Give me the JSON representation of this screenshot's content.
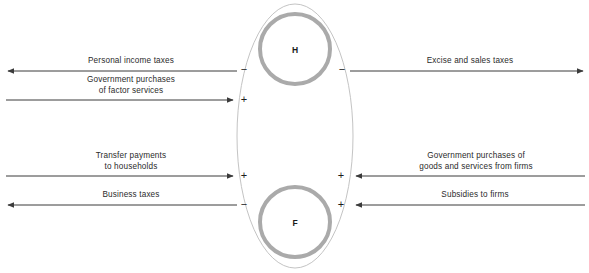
{
  "diagram": {
    "type": "circular-flow-government-sector",
    "nodes": [
      {
        "id": "households",
        "label": "H",
        "cx": 295,
        "cy": 49,
        "r": 35
      },
      {
        "id": "firms",
        "label": "F",
        "cx": 295,
        "cy": 222,
        "r": 35
      }
    ],
    "ellipse": {
      "cx": 295,
      "cy": 136,
      "rx": 58,
      "ry": 132
    },
    "colors": {
      "ring": "#a8a8a8",
      "ellipse_outline": "#bdbdbd",
      "arrow": "#3b3b3b",
      "text": "#2b2b2b"
    },
    "flows": [
      {
        "id": "personal-income-taxes",
        "label": "Personal income taxes",
        "side": "left",
        "direction": "left",
        "y": 71,
        "x_start": 237,
        "x_end": 6,
        "sign": "−",
        "sign_x": 240,
        "sign_y": 66
      },
      {
        "id": "government-purchases-factor-services",
        "label": "Government purchases\nof factor services",
        "side": "left",
        "direction": "right",
        "y": 100,
        "x_start": 6,
        "x_end": 235,
        "sign": "+",
        "sign_x": 240,
        "sign_y": 95
      },
      {
        "id": "transfer-payments-households",
        "label": "Transfer payments\nto households",
        "side": "left",
        "direction": "right",
        "y": 176,
        "x_start": 6,
        "x_end": 235,
        "sign": "+",
        "sign_x": 240,
        "sign_y": 171
      },
      {
        "id": "business-taxes",
        "label": "Business taxes",
        "side": "left",
        "direction": "left",
        "y": 205,
        "x_start": 237,
        "x_end": 6,
        "sign": "−",
        "sign_x": 240,
        "sign_y": 200
      },
      {
        "id": "excise-and-sales-taxes",
        "label": "Excise and sales taxes",
        "side": "right",
        "direction": "right",
        "y": 71,
        "x_start": 352,
        "x_end": 583,
        "sign": "−",
        "sign_x": 338,
        "sign_y": 66
      },
      {
        "id": "government-purchases-goods-services",
        "label": "Government purchases of\ngoods and services from firms",
        "side": "right",
        "direction": "left",
        "y": 176,
        "x_start": 583,
        "x_end": 354,
        "sign": "+",
        "sign_x": 338,
        "sign_y": 171
      },
      {
        "id": "subsidies-to-firms",
        "label": "Subsidies to firms",
        "side": "right",
        "direction": "left",
        "y": 205,
        "x_start": 583,
        "x_end": 354,
        "sign": "+",
        "sign_x": 338,
        "sign_y": 200
      }
    ],
    "label_positions": [
      {
        "id": "personal-income-taxes",
        "left": 76,
        "top": 58,
        "width": 110
      },
      {
        "id": "government-purchases-factor-services",
        "left": 66,
        "top": 76,
        "width": 130
      },
      {
        "id": "transfer-payments-households",
        "left": 76,
        "top": 152,
        "width": 110
      },
      {
        "id": "business-taxes",
        "left": 86,
        "top": 192,
        "width": 90
      },
      {
        "id": "excise-and-sales-taxes",
        "left": 410,
        "top": 58,
        "width": 120
      },
      {
        "id": "government-purchases-goods-services",
        "left": 402,
        "top": 152,
        "width": 145
      },
      {
        "id": "subsidies-to-firms",
        "left": 420,
        "top": 192,
        "width": 110
      }
    ]
  }
}
